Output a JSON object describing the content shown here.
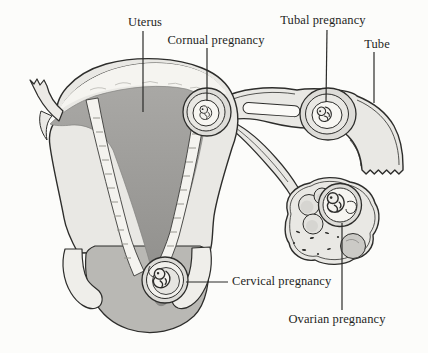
{
  "labels": {
    "uterus": "Uterus",
    "cornual_pregnancy": "Cornual pregnancy",
    "tubal_pregnancy": "Tubal pregnancy",
    "tube": "Tube",
    "cervical_pregnancy": "Cervical pregnancy",
    "ovarian_pregnancy": "Ovarian pregnancy"
  },
  "colors": {
    "ink": "#2d2d2b",
    "tissue": "#e9e8e4",
    "tissue_inner": "#f4f3ef",
    "sac_ring": "#dddcd8",
    "sac_mid": "#e9e8e4",
    "sac_core": "#f7f6f2",
    "cavity": "#9e9d9a",
    "vault": "#b9b8b4",
    "background": "#fcfcfa",
    "label_text": "#1f1f1d"
  }
}
